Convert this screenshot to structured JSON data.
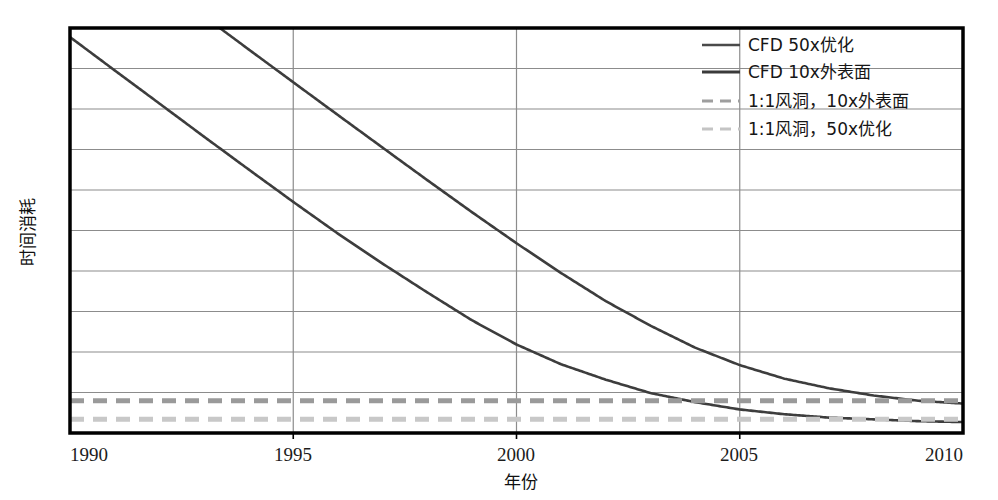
{
  "chart_data": {
    "type": "line",
    "title": "",
    "xlabel": "年份",
    "ylabel": "时间消耗",
    "xlim": [
      1990,
      2010
    ],
    "ylim": [
      0,
      10
    ],
    "grid": true,
    "grid_axis": "both",
    "xticks": [
      1990,
      1995,
      2000,
      2005,
      2010
    ],
    "xtick_labels": [
      "1990",
      "1995",
      "2000",
      "2005",
      "2010"
    ],
    "yticks": [
      0,
      1,
      2,
      3,
      4,
      5,
      6,
      7,
      8,
      9,
      10
    ],
    "ytick_labels": [
      "",
      "",
      "",
      "",
      "",
      "",
      "",
      "",
      "",
      "",
      ""
    ],
    "legend_position": "upper right",
    "series": [
      {
        "name": "CFD 50x优化",
        "style": "solid",
        "color": "#3d3d3d",
        "x": [
          1990,
          1991,
          1992,
          1993,
          1994,
          1995,
          1996,
          1997,
          1998,
          1999,
          2000,
          2001,
          2002,
          2003,
          2004,
          2005,
          2006,
          2007,
          2008,
          2009,
          2010
        ],
        "y": [
          88.0,
          55.0,
          34.5,
          21.6,
          13.6,
          8.6,
          5.5,
          3.6,
          2.4,
          1.62,
          1.15,
          0.87,
          0.7,
          0.58,
          0.51,
          0.46,
          0.43,
          0.41,
          0.4,
          0.39,
          0.385
        ]
      },
      {
        "name": "CFD 10x外表面",
        "style": "solid",
        "color": "#3d3d3d",
        "x": [
          1990,
          1991,
          1992,
          1993,
          1994,
          1995,
          1996,
          1997,
          1998,
          1999,
          2000,
          2001,
          2002,
          2003,
          2004,
          2005,
          2006,
          2007,
          2008,
          2009,
          2010
        ],
        "y": [
          480.0,
          300.0,
          188.0,
          118.0,
          74.0,
          46.5,
          29.3,
          18.5,
          11.7,
          7.45,
          4.8,
          3.15,
          2.12,
          1.5,
          1.1,
          0.86,
          0.71,
          0.62,
          0.56,
          0.52,
          0.5
        ]
      },
      {
        "name": "1:1风洞，10x外表面",
        "style": "dashed",
        "color": "#9a9a9a",
        "constant_y": 0.52
      },
      {
        "name": "1:1风洞，50x优化",
        "style": "dashed",
        "color": "#c8c8c8",
        "constant_y": 0.4
      }
    ]
  },
  "legend": {
    "items": [
      {
        "label": "CFD 50x优化",
        "style": "solid",
        "color": "#4a4a4a"
      },
      {
        "label": "CFD 10x外表面",
        "style": "solid",
        "color": "#3a3a3a"
      },
      {
        "label": "1:1风洞，10x外表面",
        "style": "dashed",
        "color": "#9e9e9e"
      },
      {
        "label": "1:1风洞，50x优化",
        "style": "dashed",
        "color": "#c4c4c4"
      }
    ]
  },
  "axes": {
    "x_title": "年份",
    "y_title": "时间消耗",
    "x_tick_0": "1990",
    "x_tick_1": "1995",
    "x_tick_2": "2000",
    "x_tick_3": "2005",
    "x_tick_4": "2010"
  },
  "colors": {
    "frame": "#000000",
    "gridline": "#8c8c8c",
    "curve": "#3d3d3d",
    "dash_dark": "#9a9a9a",
    "dash_light": "#c8c8c8",
    "background": "#ffffff"
  }
}
